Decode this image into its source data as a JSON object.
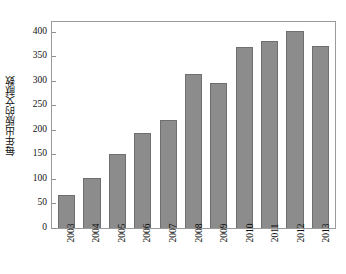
{
  "chart_data": {
    "type": "bar",
    "title": "",
    "subtitle": "",
    "xlabel": "",
    "ylabel": "每年出版的文献数",
    "categories": [
      "2003",
      "2004",
      "2005",
      "2006",
      "2007",
      "2008",
      "2009",
      "2010",
      "2011",
      "2012",
      "2013"
    ],
    "values": [
      67,
      101,
      150,
      194,
      221,
      315,
      295,
      370,
      382,
      402,
      371
    ],
    "series": [
      {
        "name": "每年出版的文献数",
        "values": [
          67,
          101,
          150,
          194,
          221,
          315,
          295,
          370,
          382,
          402,
          371
        ]
      }
    ],
    "ylim": [
      0,
      420
    ],
    "yticks": [
      0,
      50,
      100,
      150,
      200,
      250,
      300,
      350,
      400
    ],
    "ytick_labels": [
      "0",
      "50",
      "100",
      "150",
      "200",
      "250",
      "300",
      "350",
      "400"
    ],
    "xtick_labels": [
      "2003",
      "2004",
      "2005",
      "2006",
      "2007",
      "2008",
      "2009",
      "2010",
      "2011",
      "2012",
      "2013"
    ],
    "xtick_rotation": 90,
    "grid": false,
    "legend": null,
    "legend_position": "none",
    "bar_color": "#8c8c8c",
    "bar_edge_color": "#6f6f6f",
    "axis_color": "#9a9a9a",
    "background_color": "#ffffff",
    "annotations": []
  }
}
